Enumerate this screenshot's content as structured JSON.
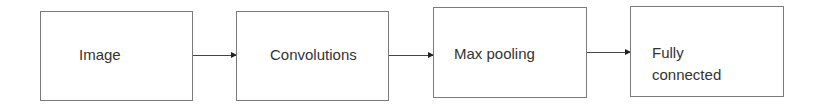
{
  "diagram": {
    "type": "flowchart",
    "direction": "left-to-right",
    "nodes": [
      {
        "id": "image",
        "label": "Image"
      },
      {
        "id": "convolutions",
        "label": "Convolutions"
      },
      {
        "id": "max_pooling",
        "label": "Max pooling"
      },
      {
        "id": "fully_connected",
        "label_line1": "Fully",
        "label_line2": "connected"
      }
    ],
    "edges": [
      {
        "from": "image",
        "to": "convolutions"
      },
      {
        "from": "convolutions",
        "to": "max_pooling"
      },
      {
        "from": "max_pooling",
        "to": "fully_connected"
      }
    ]
  }
}
